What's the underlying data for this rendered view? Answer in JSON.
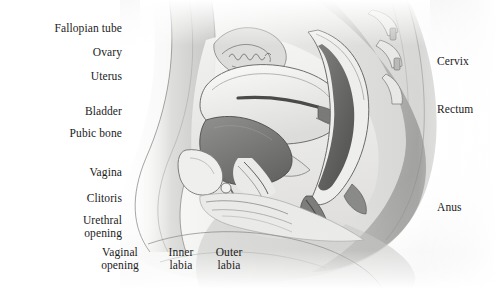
{
  "figure": {
    "kind": "anatomical-illustration",
    "style": "grayscale pencil/airbrush medical drawing",
    "background_color": "#ffffff",
    "ink_color": "#1b1b1b",
    "leader_line_color": "#3a3a3a",
    "width": 498,
    "height": 289
  },
  "labels": {
    "left": [
      {
        "id": "fallopian-tube",
        "text": "Fallopian tube"
      },
      {
        "id": "ovary",
        "text": "Ovary"
      },
      {
        "id": "uterus",
        "text": "Uterus"
      },
      {
        "id": "bladder",
        "text": "Bladder"
      },
      {
        "id": "pubic-bone",
        "text": "Pubic bone"
      },
      {
        "id": "vagina",
        "text": "Vagina"
      },
      {
        "id": "clitoris",
        "text": "Clitoris"
      },
      {
        "id": "urethral-opening",
        "text": "Urethral\nopening"
      }
    ],
    "bottom": [
      {
        "id": "vaginal-opening",
        "text": "Vaginal\nopening"
      },
      {
        "id": "inner-labia",
        "text": "Inner\nlabia"
      },
      {
        "id": "outer-labia",
        "text": "Outer\nlabia"
      }
    ],
    "right": [
      {
        "id": "cervix",
        "text": "Cervix"
      },
      {
        "id": "rectum",
        "text": "Rectum"
      },
      {
        "id": "anus",
        "text": "Anus"
      }
    ]
  }
}
